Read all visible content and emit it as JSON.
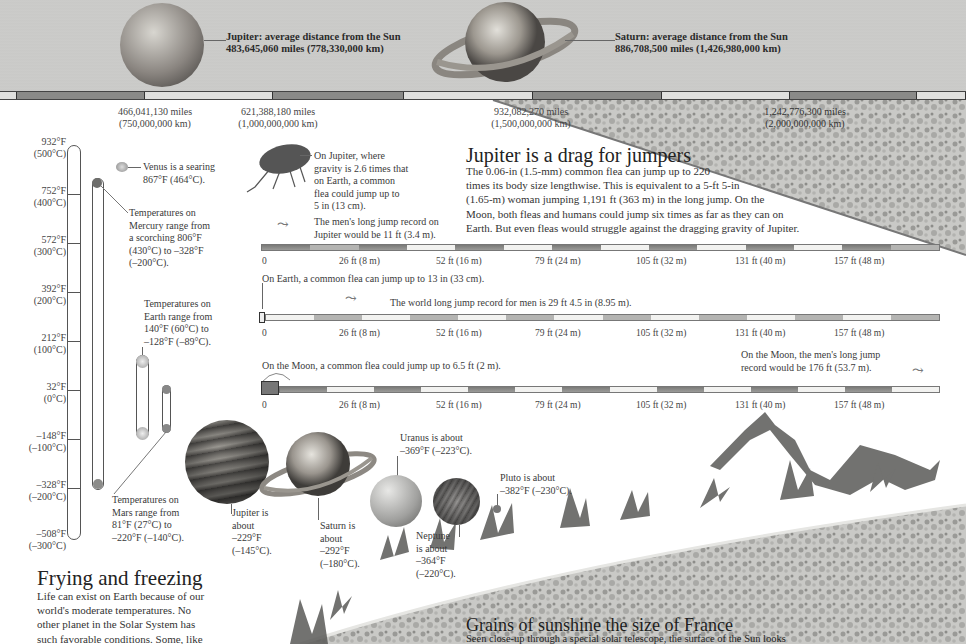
{
  "top": {
    "jupiter_label": [
      "Jupiter: average distance from the Sun",
      "483,645,060 miles (778,330,000 km)"
    ],
    "saturn_label": [
      "Saturn: average distance from the Sun",
      "886,708,500 miles (1,426,980,000 km)"
    ],
    "distance_markers": [
      {
        "miles": "466,041,130 miles",
        "km": "(750,000,000 km)"
      },
      {
        "miles": "621,388,180 miles",
        "km": "(1,000,000,000 km)"
      },
      {
        "miles": "932,082,270 miles",
        "km": "(1,500,000,000 km)"
      },
      {
        "miles": "1,242,776,300 miles",
        "km": "(2,000,000,000 km)"
      }
    ]
  },
  "thermometer": {
    "labels": [
      {
        "f": "932°F",
        "c": "(500°C)"
      },
      {
        "f": "752°F",
        "c": "(400°C)"
      },
      {
        "f": "572°F",
        "c": "(300°C)"
      },
      {
        "f": "392°F",
        "c": "(200°C)"
      },
      {
        "f": "212°F",
        "c": "(100°C)"
      },
      {
        "f": "32°F",
        "c": "(0°C)"
      },
      {
        "f": "–148°F",
        "c": "(–100°C)"
      },
      {
        "f": "–328°F",
        "c": "(–200°C)"
      },
      {
        "f": "–508°F",
        "c": "(–300°C)"
      }
    ]
  },
  "notes": {
    "venus": [
      "Venus is a searing",
      "867°F (464°C)."
    ],
    "mercury": [
      "Temperatures on",
      "Mercury range from",
      "a scorching 806°F",
      "(430°C) to –328°F",
      "(–200°C)."
    ],
    "earth": [
      "Temperatures on",
      "Earth range from",
      "140°F (60°C) to",
      "–128°F (–89°C)."
    ],
    "mars": [
      "Temperatures on",
      "Mars range from",
      "81°F (27°C) to",
      "–220°F (–140°C)."
    ],
    "jupiter": [
      "Jupiter is",
      "about",
      "–229°F",
      "(–145°C)."
    ],
    "saturn": [
      "Saturn is",
      "about",
      "–292°F",
      "(–180°C)."
    ],
    "uranus": [
      "Uranus is about",
      "–369°F (–223°C)."
    ],
    "neptune": [
      "Neptune",
      "is about",
      "–364°F",
      "(–220°C)."
    ],
    "pluto": [
      "Pluto is about",
      "–382°F (–230°C)."
    ]
  },
  "jumpers": {
    "title": "Jupiter is a drag for jumpers",
    "body": [
      "The 0.06-in (1.5-mm) common flea can jump up to 220",
      "times its body size lengthwise. This is equivalent to a 5-ft 5-in",
      "(1.65-m) woman jumping 1,191 ft (363 m) in the long jump. On the",
      "Moon, both fleas and humans could jump six times as far as they can on",
      "Earth. But even fleas would struggle against the dragging gravity of Jupiter."
    ],
    "flea_jupiter": [
      "On Jupiter, where",
      "gravity is 2.6 times that",
      "on Earth, a common",
      "flea could jump up to",
      "5 in (13 cm)."
    ],
    "man_jupiter": [
      "The men's long jump record on",
      "Jupiter would be 11 ft (3.4 m)."
    ],
    "flea_earth": "On Earth, a common flea can jump up to 13 in (33 cm).",
    "man_earth": "The world long jump record for men is 29 ft 4.5 in (8.95 m).",
    "flea_moon": "On the Moon, a common flea could jump up to 6.5 ft (2 m).",
    "man_moon": [
      "On the Moon, the men's long jump",
      "record would be 176 ft (53.7 m)."
    ],
    "ticks": [
      "0",
      "26 ft (8 m)",
      "52 ft (16 m)",
      "79 ft (24 m)",
      "105 ft (32 m)",
      "131 ft (40 m)",
      "157 ft (48 m)"
    ]
  },
  "frying": {
    "title": "Frying and freezing",
    "body": [
      "Life can exist on Earth because of our",
      "world's moderate temperatures. No",
      "other planet in the Solar System has",
      "such favorable conditions. Some, like"
    ]
  },
  "sunshine": {
    "title": "Grains of sunshine the size of France",
    "body": "Seen close-up through a special solar telescope, the surface of the Sun looks"
  }
}
